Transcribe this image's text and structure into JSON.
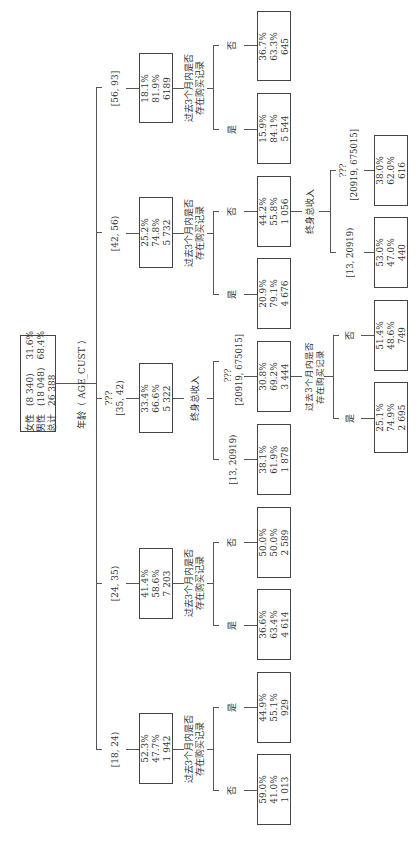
{
  "root": {
    "rows": [
      {
        "label": "女性",
        "count": "(8 340)",
        "pct": "31.6%"
      },
      {
        "label": "男性",
        "count": "(18 048)",
        "pct": "68.4%"
      },
      {
        "label": "总计",
        "count": "26 388",
        "pct": ""
      }
    ],
    "split_label": "年龄（ AGE_CUST ）"
  },
  "level1": [
    {
      "range": "[56, 93]",
      "pcts": [
        "18.1%",
        "81.9%",
        "6189"
      ],
      "split": "过去3个月内是否\n存在购买记录",
      "split_l1": "过去3个月内是否",
      "split_l2": "存在购买记录"
    },
    {
      "range": "[42, 56)",
      "pcts": [
        "25.2%",
        "74.8%",
        "5 732"
      ],
      "split_l1": "过去3个月内是否",
      "split_l2": "存在购买记录"
    },
    {
      "range_l1": "???",
      "range": "[35, 42)",
      "pcts": [
        "33.4%",
        "66.6%",
        "5 322"
      ],
      "split_l1": "终身总收入"
    },
    {
      "range": "[24, 35)",
      "pcts": [
        "41.4%",
        "58.6%",
        "7 203"
      ],
      "split_l1": "过去3个月内是否",
      "split_l2": "存在购买记录"
    },
    {
      "range": "[18, 24)",
      "pcts": [
        "52.3%",
        "47.7%",
        "1 942"
      ],
      "split_l1": "过去3个月内是否",
      "split_l2": "存在购买记录"
    }
  ],
  "level2": [
    {
      "parent": "[56, 93]",
      "branch": "否",
      "vals": [
        "36.7%",
        "63.3%",
        "645"
      ]
    },
    {
      "parent": "[56, 93]",
      "branch": "是",
      "vals": [
        "15.9%",
        "84.1%",
        "5 544"
      ]
    },
    {
      "parent": "[42, 56)",
      "branch": "否",
      "vals": [
        "44.2%",
        "55.8%",
        "1 056"
      ],
      "split_l1": "终身总收入"
    },
    {
      "parent": "[42, 56)",
      "branch": "是",
      "vals": [
        "20.9%",
        "79.1%",
        "4 676"
      ]
    },
    {
      "parent": "[35, 42)",
      "branch_l1": "???",
      "branch": "[20919, 675015]",
      "vals": [
        "30.8%",
        "69.2%",
        "3 444"
      ],
      "split_l1": "过去3个月内是否",
      "split_l2": "存在购买记录"
    },
    {
      "parent": "[35, 42)",
      "branch": "[13, 20919)",
      "vals": [
        "38.1%",
        "61.9%",
        "1 878"
      ]
    },
    {
      "parent": "[24, 35)",
      "branch": "否",
      "vals": [
        "50.0%",
        "50.0%",
        "2 589"
      ]
    },
    {
      "parent": "[24, 35)",
      "branch": "是",
      "vals": [
        "36.6%",
        "63.4%",
        "4 614"
      ]
    },
    {
      "parent": "[18, 24)",
      "branch": "是",
      "vals": [
        "44.9%",
        "55.1%",
        "929"
      ]
    },
    {
      "parent": "[18, 24)",
      "branch": "否",
      "vals": [
        "59.0%",
        "41.0%",
        "1 013"
      ]
    }
  ],
  "level3": [
    {
      "parent": "1 056",
      "branch_l1": "???",
      "branch": "[20919, 675015]",
      "vals": [
        "38.0%",
        "62.0%",
        "616"
      ]
    },
    {
      "parent": "1 056",
      "branch": "[13, 20919)",
      "vals": [
        "53.0%",
        "47.0%",
        "440"
      ]
    },
    {
      "parent": "3 444",
      "branch": "否",
      "vals": [
        "51.4%",
        "48.6%",
        "749"
      ]
    },
    {
      "parent": "3 444",
      "branch": "是",
      "vals": [
        "25.1%",
        "74.9%",
        "2 695"
      ]
    }
  ]
}
